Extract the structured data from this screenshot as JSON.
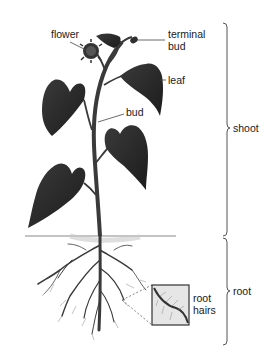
{
  "diagram": {
    "labels": {
      "flower": "flower",
      "terminal_bud_line1": "terminal",
      "terminal_bud_line2": "bud",
      "leaf": "leaf",
      "bud": "bud",
      "shoot": "shoot",
      "root": "root",
      "root_hairs_line1": "root",
      "root_hairs_line2": "hairs"
    },
    "regions": [
      {
        "name": "shoot",
        "bracket_top": 23,
        "bracket_bottom": 236
      },
      {
        "name": "root",
        "bracket_top": 238,
        "bracket_bottom": 345
      }
    ],
    "colors": {
      "plant": "#2b2b2b",
      "stem": "#3a3a3a",
      "soil": "#8a8a8a",
      "bracket": "#555555",
      "text": "#1a1a1a"
    }
  }
}
